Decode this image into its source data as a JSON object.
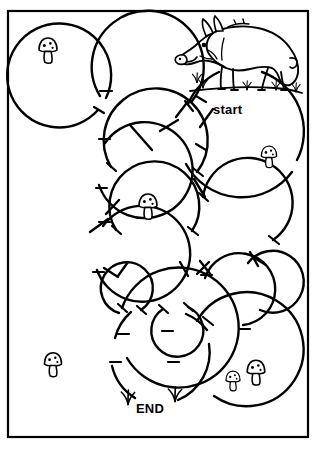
{
  "puzzle": {
    "type": "maze",
    "title": "Wild Boar Circle Maze",
    "labels": {
      "start": "start",
      "end": "END"
    },
    "colors": {
      "ink": "#000000",
      "paper": "#ffffff"
    },
    "border": {
      "x": 8,
      "y": 11,
      "width": 300,
      "height": 426,
      "stroke_width": 2.2
    }
  },
  "illustration": {
    "animal": {
      "name": "wild-boar",
      "facing": "left",
      "features": [
        "tusk",
        "snout",
        "bristles",
        "curly-tail",
        "hooves"
      ],
      "position": {
        "x": 176,
        "y": 14,
        "width": 130,
        "height": 80
      }
    },
    "ground": {
      "name": "grass-tufts-under-boar",
      "count": 4
    }
  },
  "decorations": {
    "mushrooms": [
      {
        "name": "mushroom-top-left",
        "x": 36,
        "y": 38,
        "size": 26,
        "spotted": true
      },
      {
        "name": "mushroom-right-upper",
        "x": 258,
        "y": 146,
        "size": 22,
        "spotted": true
      },
      {
        "name": "mushroom-center",
        "x": 135,
        "y": 194,
        "size": 26,
        "spotted": true
      },
      {
        "name": "mushroom-bottom-left",
        "x": 41,
        "y": 352,
        "size": 24,
        "spotted": true
      },
      {
        "name": "mushroom-bottom-right-small",
        "x": 222,
        "y": 372,
        "size": 20,
        "spotted": true
      },
      {
        "name": "mushroom-bottom-right-tall",
        "x": 243,
        "y": 360,
        "size": 26,
        "spotted": true
      }
    ],
    "grass_tufts": [
      {
        "name": "grass-tuft-end-left",
        "x": 124,
        "y": 392
      },
      {
        "name": "grass-tuft-end-right",
        "x": 170,
        "y": 388
      }
    ]
  },
  "maze_structure": {
    "wall_style": "overlapping-circle-arcs",
    "stroke_width": 2.4,
    "circles": [
      {
        "id": "c1",
        "cx": 62,
        "cy": 75,
        "r": 52
      },
      {
        "id": "c2",
        "cx": 148,
        "cy": 76,
        "r": 56
      },
      {
        "id": "c3",
        "cx": 243,
        "cy": 132,
        "r": 63
      },
      {
        "id": "c4",
        "cx": 64,
        "cy": 160,
        "r": 48
      },
      {
        "id": "c5",
        "cx": 152,
        "cy": 152,
        "r": 52
      },
      {
        "id": "c6",
        "cx": 64,
        "cy": 243,
        "r": 48
      },
      {
        "id": "c7",
        "cx": 155,
        "cy": 213,
        "r": 45
      },
      {
        "id": "c8",
        "cx": 240,
        "cy": 213,
        "r": 45
      },
      {
        "id": "c9",
        "cx": 72,
        "cy": 337,
        "r": 60
      },
      {
        "id": "c10",
        "cx": 127,
        "cy": 289,
        "r": 26
      },
      {
        "id": "c11",
        "cx": 175,
        "cy": 286,
        "r": 26
      },
      {
        "id": "c12",
        "cx": 231,
        "cy": 291,
        "r": 36
      },
      {
        "id": "c13",
        "cx": 272,
        "cy": 282,
        "r": 31
      },
      {
        "id": "c14",
        "cx": 160,
        "cy": 353,
        "r": 52
      },
      {
        "id": "c15",
        "cx": 240,
        "cy": 352,
        "r": 57
      }
    ]
  }
}
